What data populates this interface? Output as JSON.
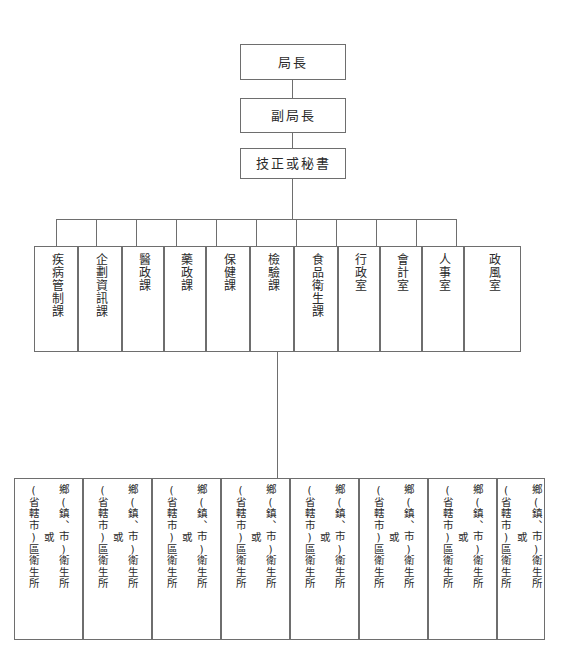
{
  "diagram": {
    "line_color": "#6e6e6e",
    "background_color": "#ffffff"
  },
  "top_chain": [
    {
      "label": "局長"
    },
    {
      "label": "副局長"
    },
    {
      "label": "技正或秘書"
    }
  ],
  "departments": [
    {
      "label": "疾病管制課"
    },
    {
      "label": "企劃資訊課"
    },
    {
      "label": "醫政課"
    },
    {
      "label": "藥政課"
    },
    {
      "label": "保健課"
    },
    {
      "label": "檢驗課"
    },
    {
      "label": "食品衛生課"
    },
    {
      "label": "行政室"
    },
    {
      "label": "會計室"
    },
    {
      "label": "人事室"
    },
    {
      "label": "政風室"
    }
  ],
  "health_stations": {
    "primary_label": "鄉(鎮、市)衛生所",
    "conjunction_label": "或",
    "alternate_label": "(省轄市)區衛生所",
    "items": [
      {
        "index": "1"
      },
      {
        "index": "2"
      },
      {
        "index": "3"
      },
      {
        "index": "4"
      },
      {
        "index": "5"
      },
      {
        "index": "6"
      },
      {
        "index": "7"
      },
      {
        "index": "8"
      }
    ]
  }
}
